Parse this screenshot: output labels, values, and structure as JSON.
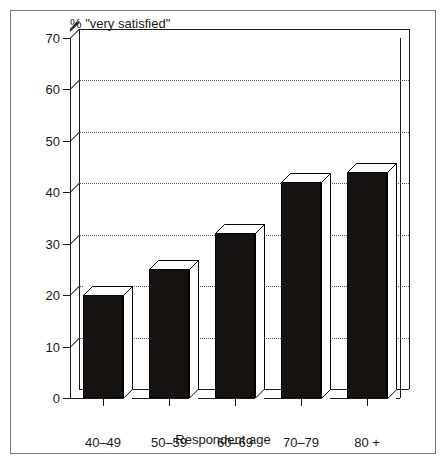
{
  "chart_data": {
    "type": "bar",
    "title": "% \"very satisfied\"",
    "xlabel": "Respondent age",
    "ylabel": "",
    "categories": [
      "40–49",
      "50–59",
      "60–69",
      "70–79",
      "80 +"
    ],
    "values": [
      20,
      25,
      32,
      42,
      44
    ],
    "yticks": [
      0,
      10,
      20,
      30,
      40,
      50,
      60,
      70
    ],
    "ylim": [
      0,
      70
    ],
    "grid": true,
    "legend": false,
    "style": "3d-column",
    "colors": {
      "bar_front": "#161310",
      "bar_top": "#ffffff",
      "bar_side": "#ffffff",
      "axis": "#1a1a1a",
      "grid": "#555555",
      "frame": "#7b7b7b",
      "background": "#ffffff"
    }
  }
}
